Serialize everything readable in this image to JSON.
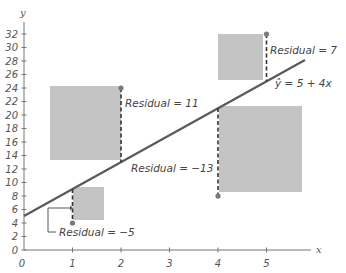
{
  "chart_data": {
    "type": "scatter",
    "title": "",
    "xlabel": "x",
    "ylabel": "y",
    "xlim": [
      0,
      5.8
    ],
    "ylim": [
      0,
      33
    ],
    "grid": false,
    "x_ticks": [
      "0",
      "1",
      "2",
      "3",
      "4",
      "5"
    ],
    "y_ticks": [
      "0",
      "2",
      "4",
      "6",
      "8",
      "10",
      "12",
      "14",
      "16",
      "18",
      "20",
      "22",
      "24",
      "26",
      "28",
      "30",
      "32"
    ],
    "regression_line": {
      "label": "ŷ = 5 + 4x",
      "intercept": 5,
      "slope": 4
    },
    "points": [
      {
        "x": 1,
        "y": 4,
        "predicted": 9,
        "residual": -5,
        "annotation": "Residual = −5"
      },
      {
        "x": 2,
        "y": 24,
        "predicted": 13,
        "residual": 11,
        "annotation": "Residual = 11"
      },
      {
        "x": 4,
        "y": 8,
        "predicted": 21,
        "residual": -13,
        "annotation": "Residual = −13"
      },
      {
        "x": 5,
        "y": 32,
        "predicted": 25,
        "residual": 7,
        "annotation": "Residual = 7"
      }
    ],
    "squares_note": "Shaded squares have side length equal to |residual| (squared residuals)",
    "colors": {
      "square_fill": "#c4c4c4",
      "line": "#555555",
      "point": "#777777",
      "axis": "#666666"
    }
  }
}
